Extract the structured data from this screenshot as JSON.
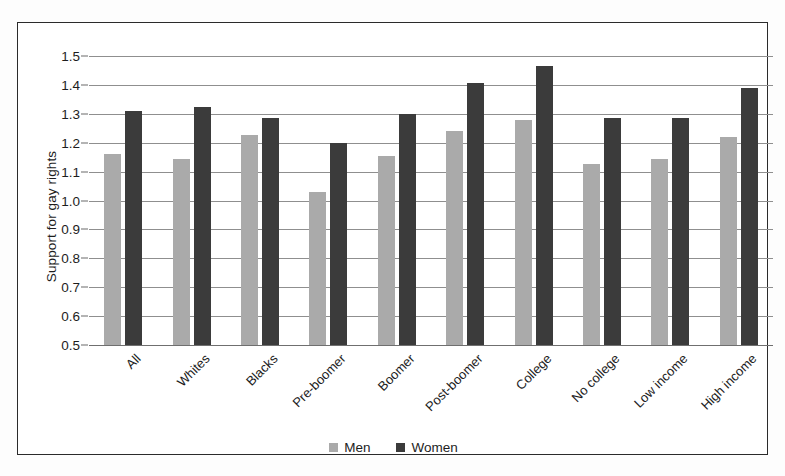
{
  "chart_data": {
    "type": "bar",
    "title": "",
    "xlabel": "",
    "ylabel": "Support for gay rights",
    "ylim": [
      0.5,
      1.5
    ],
    "yticks": [
      "0.5",
      "0.6",
      "0.7",
      "0.8",
      "0.9",
      "1.0",
      "1.1",
      "1.2",
      "1.3",
      "1.4",
      "1.5"
    ],
    "grid": true,
    "legend_position": "bottom-center",
    "categories": [
      "All",
      "Whites",
      "Blacks",
      "Pre-boomer",
      "Boomer",
      "Post-boomer",
      "College",
      "No college",
      "Low income",
      "High income"
    ],
    "series": [
      {
        "name": "Men",
        "color": "#aaaaaa",
        "values": [
          1.16,
          1.145,
          1.225,
          1.03,
          1.155,
          1.24,
          1.28,
          1.125,
          1.145,
          1.22
        ]
      },
      {
        "name": "Women",
        "color": "#3b3b3b",
        "values": [
          1.31,
          1.325,
          1.285,
          1.2,
          1.3,
          1.405,
          1.465,
          1.285,
          1.285,
          1.39
        ]
      }
    ]
  }
}
